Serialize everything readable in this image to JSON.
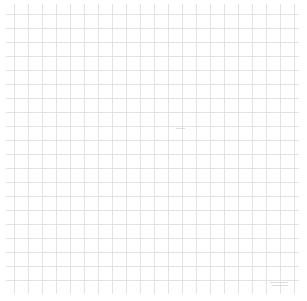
{
  "app": {
    "title": "Grid Canvas",
    "surface_label": "graph-paper-drawing-surface"
  },
  "canvas": {
    "width": 307,
    "height": 301,
    "background_color": "#ffffff",
    "grid": {
      "enabled": true,
      "line_color": "#e3e3e3",
      "line_width": 1,
      "cell_size": 14,
      "columns": 21,
      "rows": 20,
      "style": "uniform",
      "major_lines": false
    },
    "margin": {
      "top": 4,
      "left": 6,
      "right": 8,
      "bottom": 7
    }
  },
  "marks": [
    {
      "name": "stroke-center",
      "type": "horizontal-stroke",
      "x": 176,
      "y": 128,
      "length": 9,
      "thickness": 1,
      "color": "#d8d8d8"
    },
    {
      "name": "stroke-br-upper",
      "type": "horizontal-stroke",
      "x": 270,
      "y": 282,
      "length": 18,
      "thickness": 1,
      "color": "#d8d8d8"
    },
    {
      "name": "stroke-br-lower",
      "type": "horizontal-stroke",
      "x": 272,
      "y": 285,
      "length": 16,
      "thickness": 1,
      "color": "#d8d8d8"
    }
  ]
}
